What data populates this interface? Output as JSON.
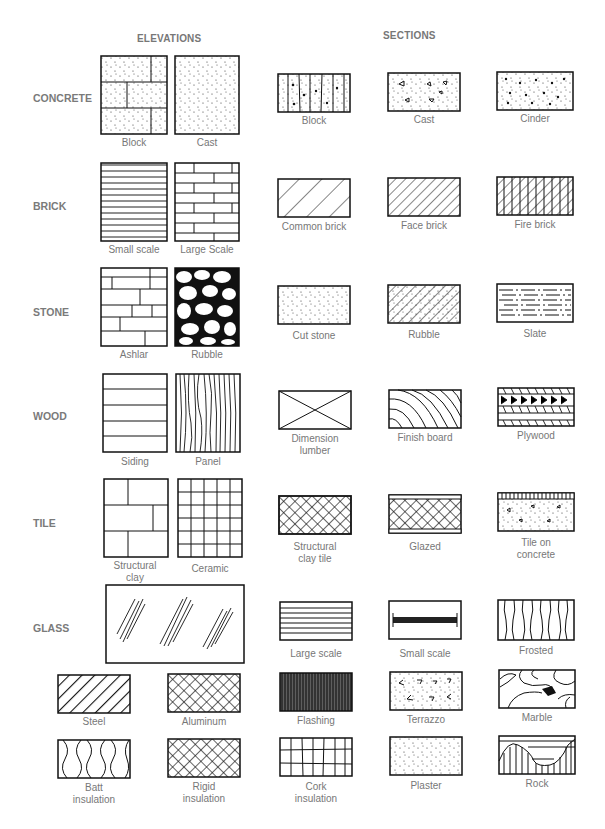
{
  "headers": {
    "elevations": "ELEVATIONS",
    "sections": "SECTIONS"
  },
  "rows": [
    {
      "label": "CONCRETE",
      "elevations": [
        "Block",
        "Cast"
      ],
      "sections": [
        "Block",
        "Cast",
        "Cinder"
      ]
    },
    {
      "label": "BRICK",
      "elevations": [
        "Small scale",
        "Large Scale"
      ],
      "sections": [
        "Common brick",
        "Face brick",
        "Fire brick"
      ]
    },
    {
      "label": "STONE",
      "elevations": [
        "Ashlar",
        "Rubble"
      ],
      "sections": [
        "Cut stone",
        "Rubble",
        "Slate"
      ]
    },
    {
      "label": "WOOD",
      "elevations": [
        "Siding",
        "Panel"
      ],
      "sections": [
        "Dimension lumber",
        "Finish board",
        "Plywood"
      ]
    },
    {
      "label": "TILE",
      "elevations": [
        "Structural clay",
        "Ceramic"
      ],
      "sections": [
        "Structural clay tile",
        "Glazed",
        "Tile on concrete"
      ]
    },
    {
      "label": "GLASS",
      "elevations": [],
      "sections": [
        "Large scale",
        "Small scale",
        "Frosted"
      ]
    }
  ],
  "misc_row1": [
    "Steel",
    "Aluminum",
    "Flashing",
    "Terrazzo",
    "Marble"
  ],
  "misc_row2": [
    "Batt insulation",
    "Rigid insulation",
    "Cork insulation",
    "Plaster",
    "Rock"
  ],
  "captions": {
    "dim_l1": "Dimension",
    "dim_l2": "lumber",
    "sct_l1": "Structural",
    "sct_l2": "clay tile",
    "toc_l1": "Tile on",
    "toc_l2": "concrete",
    "sc_l1": "Structural",
    "sc_l2": "clay",
    "batt_l1": "Batt",
    "batt_l2": "insulation",
    "rigid_l1": "Rigid",
    "rigid_l2": "insulation",
    "cork_l1": "Cork",
    "cork_l2": "insulation"
  }
}
